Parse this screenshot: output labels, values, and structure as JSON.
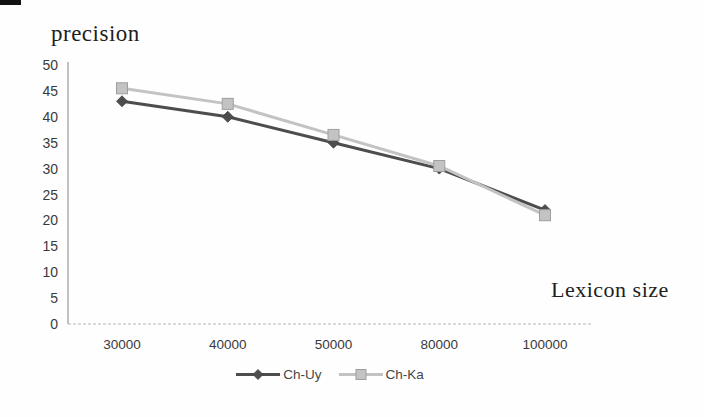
{
  "figure": {
    "scan_artifact": "black-corner-mark"
  },
  "chart_data": {
    "type": "line",
    "title": "precision",
    "xlabel": "Lexicon size",
    "ylabel": "precision",
    "categories": [
      "30000",
      "40000",
      "50000",
      "80000",
      "100000"
    ],
    "x_values": [
      30000,
      40000,
      50000,
      80000,
      100000
    ],
    "y_ticks": [
      0,
      5,
      10,
      15,
      20,
      25,
      30,
      35,
      40,
      45,
      50
    ],
    "ylim": [
      0,
      50
    ],
    "grid": false,
    "legend_position": "bottom-center",
    "axis_color": "#9e9e9e",
    "series": [
      {
        "name": "Ch-Uy",
        "marker": "diamond",
        "color": "#4d4d4d",
        "marker_border": "#3f3f3f",
        "values": [
          43,
          40,
          35,
          30,
          22
        ]
      },
      {
        "name": "Ch-Ka",
        "marker": "square",
        "color": "#c3c3c3",
        "marker_border": "#9e9e9e",
        "values": [
          45.5,
          42.5,
          36.5,
          30.5,
          21
        ]
      }
    ]
  }
}
